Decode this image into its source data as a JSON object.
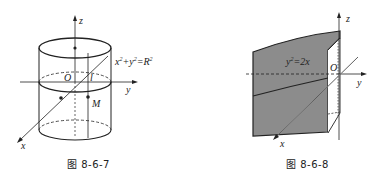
{
  "figures": [
    {
      "caption": "图 8-6-7",
      "axes": {
        "x": "x",
        "y": "y",
        "z": "z"
      },
      "origin_label": "O",
      "point_label": "M",
      "line_label": "l",
      "equation": {
        "base1": "x",
        "exp1": "2",
        "plus": "+",
        "base2": "y",
        "exp2": "2",
        "eq": "=",
        "base3": "R",
        "exp3": "2"
      },
      "shape": "cylinder"
    },
    {
      "caption": "图 8-6-8",
      "axes": {
        "x": "x",
        "y": "y",
        "z": "z"
      },
      "origin_label": "O",
      "equation": {
        "base1": "y",
        "exp1": "2",
        "rest": "=2x"
      },
      "shape": "parabolic-cylinder",
      "fill_color": "#8c8c8c"
    }
  ]
}
